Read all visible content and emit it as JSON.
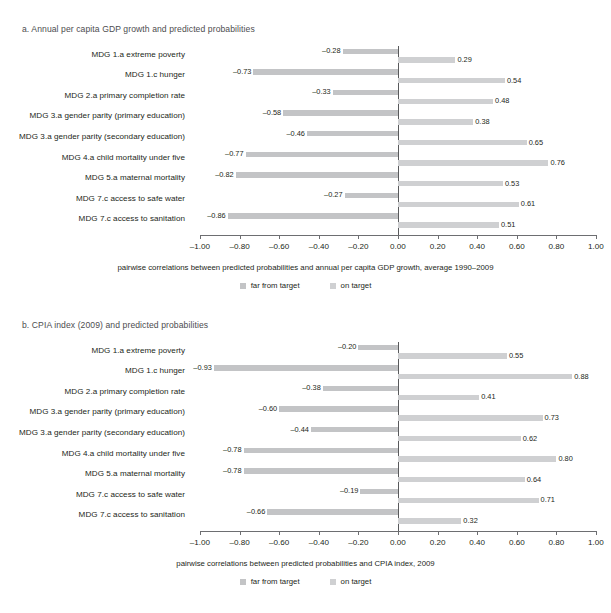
{
  "colors": {
    "far_from_target": "#c3c4c6",
    "on_target": "#cfd0d2",
    "axis": "#6d6e71",
    "zero_line": "#58595b",
    "title_text": "#4d4d4f",
    "body_text": "#231f20"
  },
  "legend": {
    "far_label": "far from target",
    "on_label": "on target"
  },
  "axis": {
    "ticks": [
      "-1.00",
      "-0.80",
      "-0.60",
      "-0.40",
      "-0.20",
      "0.00",
      "0.20",
      "0.40",
      "0.60",
      "0.80",
      "1.00"
    ],
    "tick_values": [
      -1.0,
      -0.8,
      -0.6,
      -0.4,
      -0.2,
      0.0,
      0.2,
      0.4,
      0.6,
      0.8,
      1.0
    ]
  },
  "panel_a": {
    "title": "a.  Annual per capita GDP growth and predicted probabilities",
    "caption": "pairwise correlations between predicted probabilities and annual per capita GDP growth, average 1990–2009"
  },
  "panel_b": {
    "title": "b.  CPIA index (2009) and predicted probabilities",
    "caption": "pairwise correlations between predicted probabilities and CPIA index, 2009"
  },
  "chart_data": [
    {
      "type": "bar",
      "orientation": "horizontal",
      "title": "a.  Annual per capita GDP growth and predicted probabilities",
      "xlabel": "pairwise correlations between predicted probabilities and annual per capita GDP growth, average 1990–2009",
      "ylabel": "",
      "xlim": [
        -1.0,
        1.0
      ],
      "grid": false,
      "legend_position": "bottom-center",
      "categories": [
        "MDG 1.a  extreme poverty",
        "MDG 1.c  hunger",
        "MDG 2.a  primary completion rate",
        "MDG 3.a  gender parity (primary education)",
        "MDG 3.a  gender parity (secondary education)",
        "MDG 4.a  child mortality under five",
        "MDG 5.a  maternal mortality",
        "MDG 7.c  access to safe water",
        "MDG 7.c  access to sanitation"
      ],
      "series": [
        {
          "name": "far from target",
          "values": [
            -0.28,
            -0.73,
            -0.33,
            -0.58,
            -0.46,
            -0.77,
            -0.82,
            -0.27,
            -0.86
          ],
          "labels": [
            "–0.28",
            "–0.73",
            "–0.33",
            "–0.58",
            "–0.46",
            "–0.77",
            "–0.82",
            "–0.27",
            "–0.86"
          ]
        },
        {
          "name": "on target",
          "values": [
            0.29,
            0.54,
            0.48,
            0.38,
            0.65,
            0.76,
            0.53,
            0.61,
            0.51
          ],
          "labels": [
            "0.29",
            "0.54",
            "0.48",
            "0.38",
            "0.65",
            "0.76",
            "0.53",
            "0.61",
            "0.51"
          ]
        }
      ]
    },
    {
      "type": "bar",
      "orientation": "horizontal",
      "title": "b.  CPIA index (2009) and predicted probabilities",
      "xlabel": "pairwise correlations between predicted probabilities and CPIA index, 2009",
      "ylabel": "",
      "xlim": [
        -1.0,
        1.0
      ],
      "grid": false,
      "legend_position": "bottom-center",
      "categories": [
        "MDG 1.a  extreme poverty",
        "MDG 1.c  hunger",
        "MDG 2.a  primary completion rate",
        "MDG 3.a  gender parity (primary education)",
        "MDG 3.a  gender parity (secondary education)",
        "MDG 4.a  child mortality under five",
        "MDG 5.a  maternal mortality",
        "MDG 7.c  access to safe water",
        "MDG 7.c  access to sanitation"
      ],
      "series": [
        {
          "name": "far from target",
          "values": [
            -0.2,
            -0.93,
            -0.38,
            -0.6,
            -0.44,
            -0.78,
            -0.78,
            -0.19,
            -0.66
          ],
          "labels": [
            "–0.20",
            "–0.93",
            "–0.38",
            "–0.60",
            "–0.44",
            "–0.78",
            "–0.78",
            "–0.19",
            "–0.66"
          ]
        },
        {
          "name": "on target",
          "values": [
            0.55,
            0.88,
            0.41,
            0.73,
            0.62,
            0.8,
            0.64,
            0.71,
            0.32
          ],
          "labels": [
            "0.55",
            "0.88",
            "0.41",
            "0.73",
            "0.62",
            "0.80",
            "0.64",
            "0.71",
            "0.32"
          ]
        }
      ]
    }
  ]
}
